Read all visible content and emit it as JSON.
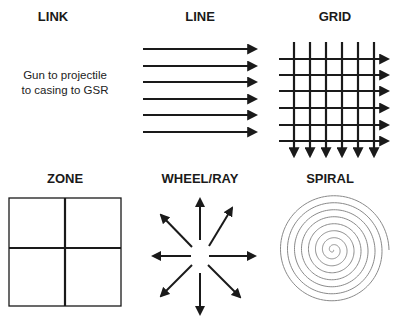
{
  "panels": {
    "link": {
      "title": "LINK",
      "description_lines": [
        "Gun to projectile",
        "to casing to GSR"
      ]
    },
    "line": {
      "title": "LINE",
      "arrow_count": 6
    },
    "grid": {
      "title": "GRID",
      "horizontal_arrows": 6,
      "vertical_arrows": 6
    },
    "zone": {
      "title": "ZONE",
      "quadrants": 4
    },
    "wheel": {
      "title": "WHEEL/RAY",
      "ray_count": 8
    },
    "spiral": {
      "title": "SPIRAL"
    }
  },
  "colors": {
    "stroke": "#1a1a1a",
    "spiral": "#8a8a8a",
    "background": "#ffffff"
  }
}
